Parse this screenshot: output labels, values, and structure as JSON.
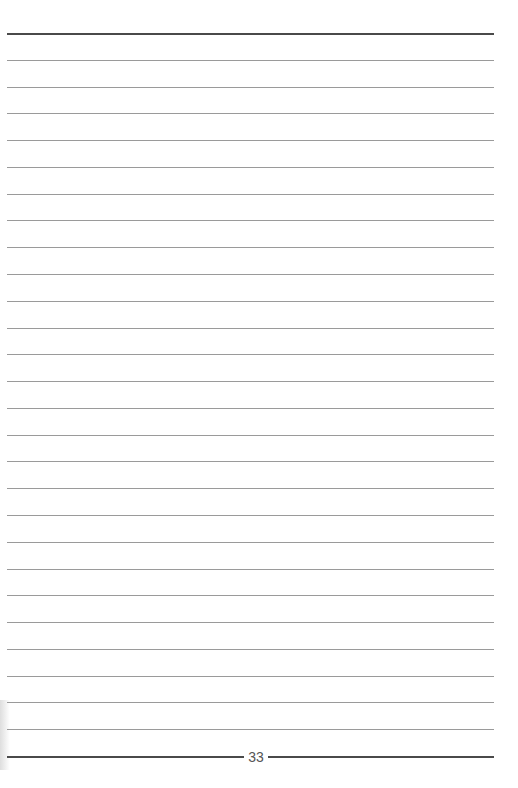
{
  "page": {
    "type": "lined-notebook-page",
    "page_number": "33",
    "top_rule_y": 33,
    "bottom_rule_y": 756,
    "line_count": 26,
    "line_spacing": 26.78,
    "colors": {
      "thin_rule": "#9a9a9a",
      "thick_rule": "#4a4a4a",
      "page_number": "#555555",
      "background": "#ffffff"
    }
  }
}
